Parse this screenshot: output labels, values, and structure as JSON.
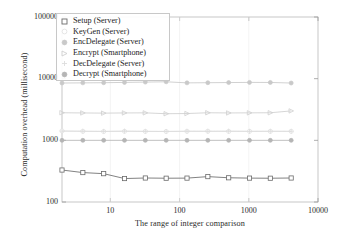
{
  "chart_data": {
    "type": "line",
    "title": "",
    "xlabel": "The range of integer comparison",
    "ylabel": "Computation overhead (millisecond)",
    "xscale": "log",
    "yscale": "log",
    "xlim": [
      2,
      10000
    ],
    "ylim": [
      100,
      100000
    ],
    "xticks": [
      "10",
      "100",
      "1000",
      "10000"
    ],
    "xtick_values": [
      10,
      100,
      1000,
      10000
    ],
    "yticks": [
      "100",
      "1000",
      "10000",
      "100000"
    ],
    "ytick_values": [
      100,
      1000,
      10000,
      100000
    ],
    "grid": false,
    "legend_position": "upper left",
    "x": [
      2,
      4,
      8,
      16,
      32,
      64,
      128,
      256,
      512,
      1024,
      2048,
      4096
    ],
    "series": [
      {
        "name": "Setup (Server)",
        "marker": "square-open",
        "color": "#6b6b6b",
        "values": [
          330,
          300,
          288,
          240,
          245,
          243,
          244,
          258,
          247,
          244,
          243,
          245
        ]
      },
      {
        "name": "KeyGen (Server)",
        "marker": "circle-open",
        "color": "#e2e2e2",
        "values": [
          1420,
          1400,
          1390,
          1400,
          1395,
          1390,
          1400,
          1405,
          1395,
          1400,
          1398,
          1400
        ]
      },
      {
        "name": "EncDelegate (Server)",
        "marker": "circle-filled",
        "color": "#c9c9c9",
        "values": [
          8500,
          8550,
          8600,
          8700,
          8800,
          8900,
          8550,
          8600,
          8650,
          8700,
          8680,
          8500
        ]
      },
      {
        "name": "Encrypt (Smartphone)",
        "marker": "triangle-open",
        "color": "#cfcfcf",
        "values": [
          2800,
          2780,
          2760,
          2780,
          2790,
          2700,
          2720,
          2800,
          2780,
          2790,
          2800,
          3000
        ]
      },
      {
        "name": "DecDelegate (Server)",
        "marker": "plus",
        "color": "#dcdcdc",
        "values": [
          1410,
          1405,
          1400,
          1410,
          1400,
          1395,
          1405,
          1400,
          1410,
          1400,
          1405,
          1400
        ]
      },
      {
        "name": "Decrypt (Smartphone)",
        "marker": "circle-filled",
        "color": "#b5b5b5",
        "values": [
          1000,
          1000,
          1000,
          1000,
          1000,
          1000,
          1000,
          1000,
          1000,
          1000,
          1000,
          1000
        ]
      }
    ]
  },
  "legend": {
    "items": [
      {
        "label": "Setup (Server)"
      },
      {
        "label": "KeyGen (Server)"
      },
      {
        "label": "EncDelegate (Server)"
      },
      {
        "label": "Encrypt (Smartphone)"
      },
      {
        "label": "DecDelegate (Server)"
      },
      {
        "label": "Decrypt (Smartphone)"
      }
    ]
  }
}
